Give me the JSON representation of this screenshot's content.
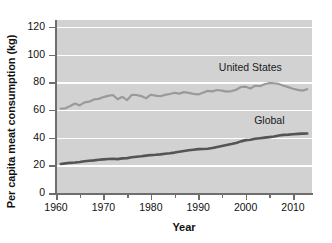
{
  "chart_data": {
    "type": "line",
    "title": "",
    "xlabel": "Year",
    "ylabel": "Per capita meat consumption (kg)",
    "xlim": [
      1960,
      2014
    ],
    "ylim": [
      0,
      125
    ],
    "yticks": [
      0,
      20,
      40,
      60,
      80,
      100,
      120
    ],
    "ytick_labels": [
      "0",
      "20",
      "40",
      "60",
      "80",
      "100",
      "120"
    ],
    "xticks": [
      1960,
      1970,
      1980,
      1990,
      2000,
      2010
    ],
    "xtick_labels": [
      "1960",
      "1970",
      "1980",
      "1990",
      "2000",
      "2010"
    ],
    "xminorticks": [
      1965,
      1975,
      1985,
      1995,
      2005
    ],
    "grid": "horizontal-white",
    "legend_position": "inline-annotation",
    "colors": {
      "united_states": "#9a9a9a",
      "global": "#545454",
      "plot_background": "#d2d2d2",
      "gridline": "#ffffff",
      "axis": "#6e6e6e",
      "text": "#111111"
    },
    "x": [
      1961,
      1962,
      1963,
      1964,
      1965,
      1966,
      1967,
      1968,
      1969,
      1970,
      1971,
      1972,
      1973,
      1974,
      1975,
      1976,
      1977,
      1978,
      1979,
      1980,
      1981,
      1982,
      1983,
      1984,
      1985,
      1986,
      1987,
      1988,
      1989,
      1990,
      1991,
      1992,
      1993,
      1994,
      1995,
      1996,
      1997,
      1998,
      1999,
      2000,
      2001,
      2002,
      2003,
      2004,
      2005,
      2006,
      2007,
      2008,
      2009,
      2010,
      2011,
      2012,
      2013
    ],
    "series": [
      {
        "name": "United States",
        "label": "United States",
        "color": "#9a9a9a",
        "values": [
          61.0,
          61.2,
          62.8,
          64.6,
          63.3,
          65.5,
          66.0,
          67.6,
          68.0,
          69.3,
          70.2,
          70.8,
          67.7,
          69.5,
          67.1,
          71.0,
          70.8,
          70.0,
          68.4,
          71.0,
          70.3,
          69.9,
          70.9,
          71.5,
          72.4,
          71.8,
          72.9,
          72.3,
          71.6,
          71.2,
          72.5,
          73.8,
          73.4,
          74.4,
          74.0,
          73.2,
          73.6,
          74.6,
          76.6,
          76.8,
          75.5,
          77.5,
          77.2,
          78.6,
          79.5,
          79.3,
          78.8,
          77.5,
          76.5,
          75.3,
          74.5,
          74.0,
          75.0
        ]
      },
      {
        "name": "Global",
        "label": "Global",
        "color": "#545454",
        "values": [
          21.0,
          21.4,
          21.8,
          22.0,
          22.4,
          22.9,
          23.3,
          23.6,
          24.0,
          24.3,
          24.6,
          24.8,
          24.5,
          25.0,
          25.2,
          25.8,
          26.2,
          26.5,
          27.0,
          27.4,
          27.6,
          27.9,
          28.3,
          28.7,
          29.2,
          29.8,
          30.4,
          30.9,
          31.3,
          31.7,
          31.8,
          32.0,
          32.5,
          33.3,
          34.0,
          34.7,
          35.4,
          36.2,
          37.3,
          38.2,
          38.5,
          39.2,
          39.6,
          40.0,
          40.4,
          40.8,
          41.6,
          42.0,
          42.2,
          42.5,
          42.7,
          42.9,
          43.0
        ]
      }
    ],
    "annotations": [
      {
        "text": "United States",
        "x": 2001,
        "y": 90
      },
      {
        "text": "Global",
        "x": 2005,
        "y": 52
      }
    ]
  }
}
